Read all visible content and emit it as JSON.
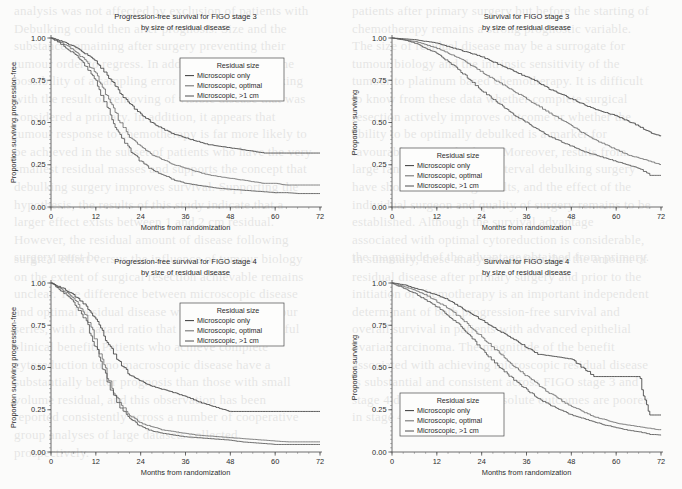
{
  "figure": {
    "background_color": "#fbfbfa",
    "ink_color": "#2c2c2c",
    "series_colors": [
      "#3f3f3f",
      "#6f6f6f",
      "#555555"
    ]
  },
  "bleed_text": {
    "col1": "analysis was not affected by exclusion of patients with Debulking could then alter prognosis. Size and the substance remaining after surgery preventing their tumour order to regress. In addition, there exists the possibility of a sampling error in the initial debulking with the result of removing of visible disease that was considered a primary. In addition, it appears that tumour response to chemotherapy is far more likely to be achieved in the subset of patients who have the very smallest residual masses and supports the concept that debulking surgery improves survival. Supporting the hypothesis, the results of this study indicate that a larger effect exists between 1 and 2 cm residual. However, the residual amount of disease following surgery must be.",
    "col2": "patients after primary surgery but before the starting of chemotherapy remains a strong prognostic variable. The size of residual disease may be a surrogate for tumour biology and the intrinsic sensitivity of the tumour to platinum based chemotherapy. It is difficult to know from these data whether complete surgical resection actively improves outcome or whether the ability to be optimally debulked is a marker for favourable tumour biology. Moreover, results from large randomised trials of interval debulking surgery have shown conflicting results, and the effect of the individual surgeon and quality of surgery remains to be established. Although the survival advantage associated with optimal cytoreduction is considerable, the magnitude of the advantage obtained from primary.",
    "col3": "surgical effort versus the influence of tumour biology on the extent of surgical resection achievable remains unclear. The difference between microscopic disease and optimal residual disease was considerable in our series, with a hazard ratio that suggests a meaningful clinical benefit. Patients who achieve complete cytoreduction to no macroscopic disease have a substantially better prognosis than those with small volume residual, and this observation has been reported consistently across a number of cooperative group analyses of large datasets collected prospectively.",
    "col4": "In summary, these analyses confirm that the amount of residual disease after primary surgery and prior to the initiation of chemotherapy is an important independent determinant of both progression-free survival and overall survival in patients with advanced epithelial ovarian carcinoma. The magnitude of the benefit associated with achieving microscopic residual disease is substantial and consistent across FIGO stage 3 and stage 4 disease, although absolute outcomes are poorer in stage 4 disease."
  },
  "panels": [
    {
      "id": "pfs-stage3",
      "title_line1": "Progression-free survival for FIGO stage 3",
      "title_line2": "by size of residual disease",
      "xlabel": "Months from randomization",
      "ylabel": "Proportion surviving progression-free",
      "xticks": [
        0,
        12,
        24,
        36,
        48,
        60,
        72
      ],
      "xticklabels": [
        "0",
        "12",
        "24",
        "36",
        "48",
        "60",
        "72"
      ],
      "yticks": [
        0.0,
        0.25,
        0.5,
        0.75,
        1.0
      ],
      "yticklabels": [
        "0.00",
        "0.25",
        "0.50",
        "0.75",
        "1.00"
      ],
      "xlim": [
        0,
        72
      ],
      "ylim": [
        0,
        1
      ],
      "legend": {
        "title": "Residual size",
        "items": [
          "Microscopic only",
          "Microscopic, optimal",
          "Microscopic, >1 cm"
        ],
        "position": "upper-right"
      }
    },
    {
      "id": "os-stage3",
      "title_line1": "Survival for FIGO stage 3",
      "title_line2": "by size of residual disease",
      "xlabel": "Months from randomization",
      "ylabel": "Proportion surviving",
      "xticks": [
        0,
        12,
        24,
        36,
        48,
        60,
        72
      ],
      "xticklabels": [
        "0",
        "12",
        "24",
        "36",
        "48",
        "60",
        "72"
      ],
      "yticks": [
        0.0,
        0.25,
        0.5,
        0.75,
        1.0
      ],
      "yticklabels": [
        "0.00",
        "0.25",
        "0.50",
        "0.75",
        "1.00"
      ],
      "xlim": [
        0,
        72
      ],
      "ylim": [
        0,
        1
      ],
      "legend": {
        "title": "Residual size",
        "items": [
          "Microscopic only",
          "Microscopic, optimal",
          "Microscopic, >1 cm"
        ],
        "position": "lower-left"
      }
    },
    {
      "id": "pfs-stage4",
      "title_line1": "Progression-free survival for FIGO stage 4",
      "title_line2": "by size of residual disease",
      "xlabel": "Months from randomization",
      "ylabel": "Proportion surviving progression-free",
      "xticks": [
        0,
        12,
        24,
        36,
        48,
        60,
        72
      ],
      "xticklabels": [
        "0",
        "12",
        "24",
        "36",
        "48",
        "60",
        "72"
      ],
      "yticks": [
        0.0,
        0.25,
        0.5,
        0.75,
        1.0
      ],
      "yticklabels": [
        "0.00",
        "0.25",
        "0.50",
        "0.75",
        "1.00"
      ],
      "xlim": [
        0,
        72
      ],
      "ylim": [
        0,
        1
      ],
      "legend": {
        "title": "Residual size",
        "items": [
          "Microscopic only",
          "Microscopic, optimal",
          "Microscopic, >1 cm"
        ],
        "position": "upper-right"
      }
    },
    {
      "id": "os-stage4",
      "title_line1": "Survival for FIGO stage 4",
      "title_line2": "by size of residual disease",
      "xlabel": "Months from randomization",
      "ylabel": "Proportion surviving",
      "xticks": [
        0,
        12,
        24,
        36,
        48,
        60,
        72
      ],
      "xticklabels": [
        "0",
        "12",
        "24",
        "36",
        "48",
        "60",
        "72"
      ],
      "yticks": [
        0.0,
        0.25,
        0.5,
        0.75,
        1.0
      ],
      "yticklabels": [
        "0.00",
        "0.25",
        "0.50",
        "0.75",
        "1.00"
      ],
      "xlim": [
        0,
        72
      ],
      "ylim": [
        0,
        1
      ],
      "legend": {
        "title": "Residual size",
        "items": [
          "Microscopic only",
          "Microscopic, optimal",
          "Microscopic, >1 cm"
        ],
        "position": "lower-left"
      }
    }
  ],
  "chart_data": [
    {
      "type": "line",
      "subplot": "top-left",
      "title": "Progression-free survival for FIGO stage 3 by size of residual disease",
      "xlabel": "Months from randomization",
      "ylabel": "Proportion surviving progression-free",
      "xlim": [
        0,
        72
      ],
      "ylim": [
        0,
        1
      ],
      "grid": false,
      "legend": "upper-right",
      "x": [
        0,
        3,
        6,
        9,
        12,
        15,
        18,
        21,
        24,
        27,
        30,
        33,
        36,
        39,
        42,
        45,
        48,
        51,
        54,
        57,
        60,
        63,
        66,
        69,
        72
      ],
      "series": [
        {
          "name": "Microscopic only",
          "values": [
            1.0,
            0.98,
            0.95,
            0.91,
            0.86,
            0.78,
            0.69,
            0.61,
            0.55,
            0.5,
            0.46,
            0.43,
            0.41,
            0.39,
            0.37,
            0.36,
            0.35,
            0.34,
            0.33,
            0.32,
            0.32,
            0.32,
            0.32,
            0.32,
            0.32
          ]
        },
        {
          "name": "Microscopic, optimal",
          "values": [
            1.0,
            0.97,
            0.93,
            0.87,
            0.79,
            0.66,
            0.52,
            0.42,
            0.36,
            0.31,
            0.28,
            0.25,
            0.23,
            0.21,
            0.19,
            0.18,
            0.17,
            0.16,
            0.15,
            0.14,
            0.14,
            0.13,
            0.13,
            0.13,
            0.13
          ]
        },
        {
          "name": "Microscopic, >1 cm",
          "values": [
            1.0,
            0.96,
            0.91,
            0.84,
            0.74,
            0.59,
            0.44,
            0.34,
            0.27,
            0.22,
            0.19,
            0.16,
            0.14,
            0.13,
            0.12,
            0.11,
            0.105,
            0.1,
            0.095,
            0.09,
            0.085,
            0.085,
            0.08,
            0.08,
            0.08
          ]
        }
      ]
    },
    {
      "type": "line",
      "subplot": "top-right",
      "title": "Survival for FIGO stage 3 by size of residual disease",
      "xlabel": "Months from randomization",
      "ylabel": "Proportion surviving",
      "xlim": [
        0,
        72
      ],
      "ylim": [
        0,
        1
      ],
      "grid": false,
      "legend": "lower-left",
      "x": [
        0,
        3,
        6,
        9,
        12,
        15,
        18,
        21,
        24,
        27,
        30,
        33,
        36,
        39,
        42,
        45,
        48,
        51,
        54,
        57,
        60,
        63,
        66,
        69,
        72
      ],
      "series": [
        {
          "name": "Microscopic only",
          "values": [
            1.0,
            0.995,
            0.99,
            0.98,
            0.97,
            0.95,
            0.93,
            0.91,
            0.89,
            0.86,
            0.83,
            0.8,
            0.77,
            0.74,
            0.7,
            0.67,
            0.64,
            0.61,
            0.58,
            0.56,
            0.54,
            0.51,
            0.48,
            0.44,
            0.42
          ]
        },
        {
          "name": "Microscopic, optimal",
          "values": [
            1.0,
            0.99,
            0.98,
            0.96,
            0.94,
            0.91,
            0.88,
            0.84,
            0.8,
            0.76,
            0.72,
            0.68,
            0.64,
            0.6,
            0.56,
            0.52,
            0.48,
            0.44,
            0.4,
            0.37,
            0.34,
            0.31,
            0.29,
            0.27,
            0.25
          ]
        },
        {
          "name": "Microscopic, >1 cm",
          "values": [
            1.0,
            0.99,
            0.97,
            0.94,
            0.91,
            0.86,
            0.81,
            0.75,
            0.69,
            0.64,
            0.59,
            0.54,
            0.5,
            0.46,
            0.42,
            0.39,
            0.36,
            0.33,
            0.31,
            0.29,
            0.27,
            0.25,
            0.23,
            0.19,
            0.19
          ]
        }
      ]
    },
    {
      "type": "line",
      "subplot": "bottom-left",
      "title": "Progression-free survival for FIGO stage 4 by size of residual disease",
      "xlabel": "Months from randomization",
      "ylabel": "Proportion surviving progression-free",
      "xlim": [
        0,
        72
      ],
      "ylim": [
        0,
        1
      ],
      "grid": false,
      "legend": "upper-right",
      "x": [
        0,
        3,
        6,
        9,
        12,
        15,
        18,
        21,
        24,
        27,
        30,
        33,
        36,
        39,
        42,
        45,
        48,
        51,
        54,
        57,
        60,
        63,
        66,
        69,
        72
      ],
      "series": [
        {
          "name": "Microscopic only",
          "values": [
            1.0,
            0.97,
            0.93,
            0.87,
            0.78,
            0.65,
            0.54,
            0.46,
            0.42,
            0.39,
            0.37,
            0.35,
            0.33,
            0.3,
            0.28,
            0.26,
            0.24,
            0.24,
            0.24,
            0.24,
            0.24,
            0.24,
            0.24,
            0.24,
            0.24
          ]
        },
        {
          "name": "Microscopic, optimal",
          "values": [
            1.0,
            0.96,
            0.91,
            0.82,
            0.66,
            0.45,
            0.3,
            0.22,
            0.17,
            0.15,
            0.13,
            0.12,
            0.11,
            0.1,
            0.095,
            0.09,
            0.085,
            0.08,
            0.075,
            0.07,
            0.065,
            0.06,
            0.06,
            0.06,
            0.06
          ]
        },
        {
          "name": "Microscopic, >1 cm",
          "values": [
            1.0,
            0.95,
            0.89,
            0.79,
            0.62,
            0.42,
            0.28,
            0.2,
            0.15,
            0.125,
            0.11,
            0.1,
            0.09,
            0.085,
            0.08,
            0.075,
            0.07,
            0.06,
            0.055,
            0.05,
            0.045,
            0.045,
            0.045,
            0.045,
            0.045
          ]
        }
      ]
    },
    {
      "type": "line",
      "subplot": "bottom-right",
      "title": "Survival for FIGO stage 4 by size of residual disease",
      "xlabel": "Months from randomization",
      "ylabel": "Proportion surviving",
      "xlim": [
        0,
        72
      ],
      "ylim": [
        0,
        1
      ],
      "grid": false,
      "legend": "lower-left",
      "x": [
        0,
        3,
        6,
        9,
        12,
        15,
        18,
        21,
        24,
        27,
        30,
        33,
        36,
        39,
        42,
        45,
        48,
        51,
        54,
        57,
        60,
        63,
        66,
        69,
        72
      ],
      "series": [
        {
          "name": "Microscopic only",
          "values": [
            1.0,
            0.99,
            0.97,
            0.95,
            0.93,
            0.9,
            0.86,
            0.82,
            0.78,
            0.74,
            0.7,
            0.66,
            0.62,
            0.58,
            0.57,
            0.56,
            0.55,
            0.5,
            0.45,
            0.45,
            0.45,
            0.45,
            0.45,
            0.23,
            0.23
          ]
        },
        {
          "name": "Microscopic, optimal",
          "values": [
            1.0,
            0.98,
            0.96,
            0.93,
            0.89,
            0.85,
            0.8,
            0.74,
            0.68,
            0.62,
            0.56,
            0.5,
            0.45,
            0.4,
            0.35,
            0.31,
            0.27,
            0.24,
            0.21,
            0.19,
            0.17,
            0.16,
            0.15,
            0.14,
            0.13
          ]
        },
        {
          "name": "Microscopic, >1 cm",
          "values": [
            1.0,
            0.97,
            0.94,
            0.9,
            0.86,
            0.81,
            0.75,
            0.68,
            0.61,
            0.54,
            0.48,
            0.42,
            0.37,
            0.32,
            0.28,
            0.25,
            0.22,
            0.2,
            0.18,
            0.16,
            0.145,
            0.13,
            0.12,
            0.105,
            0.1
          ]
        }
      ]
    }
  ]
}
